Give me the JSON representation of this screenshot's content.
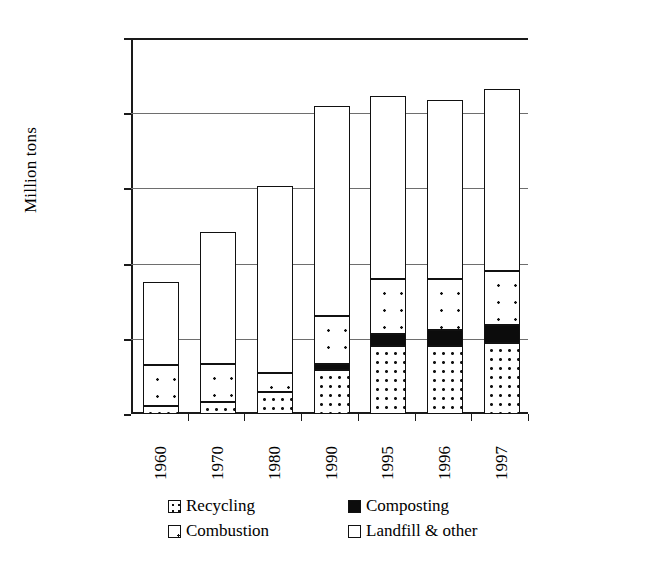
{
  "chart_data": {
    "type": "bar",
    "subtype": "stacked-bar",
    "title": "",
    "xlabel": "",
    "ylabel": "Million tons",
    "ylim": [
      0,
      250
    ],
    "yticks": [
      0,
      50,
      100,
      150,
      200,
      250
    ],
    "grid": true,
    "legend_position": "bottom",
    "categories": [
      "1960",
      "1970",
      "1980",
      "1990",
      "1995",
      "1996",
      "1997"
    ],
    "series": [
      {
        "name": "Recycling",
        "fill": "dense-dots",
        "values": [
          5.6,
          8.0,
          14.5,
          29.0,
          45.0,
          45.5,
          47.0
        ]
      },
      {
        "name": "Composting",
        "fill": "solid-black",
        "values": [
          0.0,
          0.0,
          0.0,
          4.0,
          8.5,
          10.5,
          12.0
        ]
      },
      {
        "name": "Combustion",
        "fill": "sparse-dots",
        "values": [
          27.0,
          25.0,
          13.0,
          32.0,
          36.0,
          34.0,
          36.0
        ]
      },
      {
        "name": "Landfill & other",
        "fill": "white",
        "values": [
          55.5,
          88.0,
          124.0,
          140.0,
          122.0,
          118.5,
          121.0
        ]
      }
    ],
    "totals": [
      88.1,
      121.0,
      151.5,
      205.0,
      211.5,
      208.5,
      216.0
    ]
  },
  "legend": {
    "items": [
      {
        "label": "Recycling",
        "swatch": "dense-dots"
      },
      {
        "label": "Composting",
        "swatch": "solid-black"
      },
      {
        "label": "Combustion",
        "swatch": "sparse-dots"
      },
      {
        "label": "Landfill & other",
        "swatch": "white"
      }
    ]
  }
}
